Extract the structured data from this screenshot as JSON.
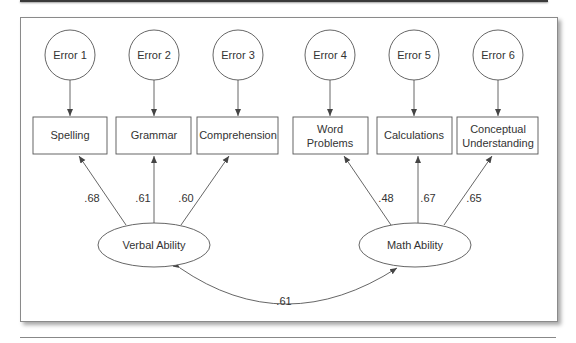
{
  "diagram": {
    "type": "structural-equation-model",
    "errors": [
      {
        "id": "e1",
        "label": "Error 1"
      },
      {
        "id": "e2",
        "label": "Error 2"
      },
      {
        "id": "e3",
        "label": "Error 3"
      },
      {
        "id": "e4",
        "label": "Error 4"
      },
      {
        "id": "e5",
        "label": "Error 5"
      },
      {
        "id": "e6",
        "label": "Error 6"
      }
    ],
    "indicators": [
      {
        "id": "spelling",
        "label": "Spelling"
      },
      {
        "id": "grammar",
        "label": "Grammar"
      },
      {
        "id": "comprehension",
        "label": "Comprehension"
      },
      {
        "id": "word_problems",
        "label_line1": "Word",
        "label_line2": "Problems"
      },
      {
        "id": "calculations",
        "label": "Calculations"
      },
      {
        "id": "conceptual",
        "label_line1": "Conceptual",
        "label_line2": "Understanding"
      }
    ],
    "factors": [
      {
        "id": "verbal",
        "label": "Verbal Ability"
      },
      {
        "id": "math",
        "label": "Math Ability"
      }
    ],
    "loadings": [
      {
        "from": "verbal",
        "to": "spelling",
        "value": ".68"
      },
      {
        "from": "verbal",
        "to": "grammar",
        "value": ".61"
      },
      {
        "from": "verbal",
        "to": "comprehension",
        "value": ".60"
      },
      {
        "from": "math",
        "to": "word_problems",
        "value": ".48"
      },
      {
        "from": "math",
        "to": "calculations",
        "value": ".67"
      },
      {
        "from": "math",
        "to": "conceptual",
        "value": ".65"
      }
    ],
    "correlation": {
      "from": "verbal",
      "to": "math",
      "value": ".61"
    }
  }
}
